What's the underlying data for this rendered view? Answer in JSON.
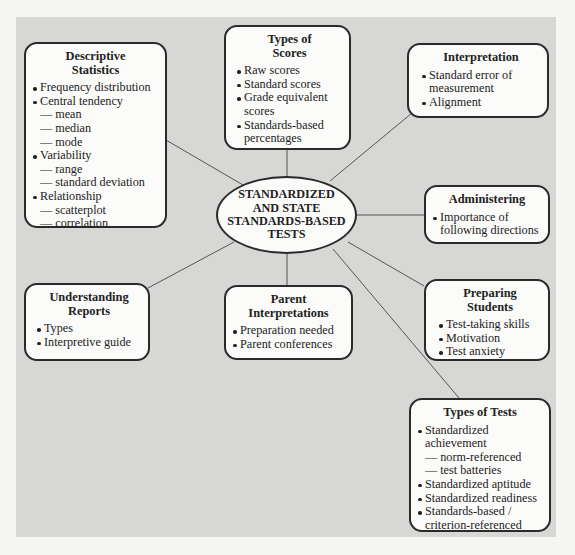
{
  "center": {
    "lines": [
      "STANDARDIZED",
      "AND STATE",
      "STANDARDS-BASED",
      "TESTS"
    ]
  },
  "nodes": {
    "descriptive_statistics": {
      "title": [
        "Descriptive",
        "Statistics"
      ],
      "items": [
        {
          "type": "bullet",
          "text": "Frequency distribution"
        },
        {
          "type": "bullet",
          "text": "Central tendency"
        },
        {
          "type": "sub",
          "text": "— mean"
        },
        {
          "type": "sub",
          "text": "— median"
        },
        {
          "type": "sub",
          "text": "— mode"
        },
        {
          "type": "bullet",
          "text": "Variability"
        },
        {
          "type": "sub",
          "text": "— range"
        },
        {
          "type": "sub",
          "text": "— standard deviation"
        },
        {
          "type": "bullet",
          "text": "Relationship"
        },
        {
          "type": "sub",
          "text": "— scatterplot"
        },
        {
          "type": "sub",
          "text": "— correlation"
        }
      ]
    },
    "types_of_scores": {
      "title": [
        "Types of",
        "Scores"
      ],
      "items": [
        {
          "type": "bullet",
          "text": "Raw scores"
        },
        {
          "type": "bullet",
          "text": "Standard scores"
        },
        {
          "type": "bullet",
          "text": "Grade equivalent"
        },
        {
          "type": "sub",
          "text": "scores"
        },
        {
          "type": "bullet",
          "text": "Standards-based"
        },
        {
          "type": "sub",
          "text": "percentages"
        }
      ]
    },
    "interpretation": {
      "title": [
        "Interpretation"
      ],
      "items": [
        {
          "type": "bullet",
          "text": "Standard error of"
        },
        {
          "type": "sub",
          "text": "measurement"
        },
        {
          "type": "bullet",
          "text": "Alignment"
        }
      ]
    },
    "administering": {
      "title": [
        "Administering"
      ],
      "items": [
        {
          "type": "bullet",
          "text": "Importance of"
        },
        {
          "type": "sub",
          "text": "following directions"
        }
      ]
    },
    "preparing_students": {
      "title": [
        "Preparing",
        "Students"
      ],
      "items": [
        {
          "type": "bullet",
          "text": "Test-taking skills"
        },
        {
          "type": "bullet",
          "text": "Motivation"
        },
        {
          "type": "bullet",
          "text": "Test anxiety"
        }
      ]
    },
    "parent_interpretations": {
      "title": [
        "Parent",
        "Interpretations"
      ],
      "items": [
        {
          "type": "bullet",
          "text": "Preparation needed"
        },
        {
          "type": "bullet",
          "text": "Parent conferences"
        }
      ]
    },
    "understanding_reports": {
      "title": [
        "Understanding",
        "Reports"
      ],
      "items": [
        {
          "type": "bullet",
          "text": "Types"
        },
        {
          "type": "bullet",
          "text": "Interpretive guide"
        }
      ]
    },
    "types_of_tests": {
      "title": [
        "Types of Tests"
      ],
      "items": [
        {
          "type": "bullet",
          "text": "Standardized"
        },
        {
          "type": "sub",
          "text": "achievement"
        },
        {
          "type": "sub",
          "text": "— norm-referenced"
        },
        {
          "type": "sub",
          "text": "— test batteries"
        },
        {
          "type": "bullet",
          "text": "Standardized aptitude"
        },
        {
          "type": "bullet",
          "text": "Standardized readiness"
        },
        {
          "type": "bullet",
          "text": "Standards-based /"
        },
        {
          "type": "sub",
          "text": "criterion-referenced"
        }
      ]
    }
  },
  "colors": {
    "panel": "#d7d7d6",
    "node_fill": "#fbfbfa",
    "border": "#2a2a2a",
    "connector": "#555555"
  }
}
